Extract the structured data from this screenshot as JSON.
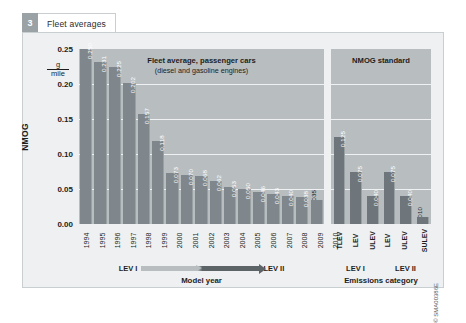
{
  "tab": {
    "number": "3",
    "label": "Fleet averages"
  },
  "credit": "© SMA00386E",
  "panels": {
    "left": {
      "title": "Fleet average, passenger cars",
      "subtitle": "(diesel and gasoline engines)"
    },
    "right": {
      "title": "NMOG standard"
    }
  },
  "yaxis": {
    "title": "NMOG",
    "unit_numerator": "g",
    "unit_denominator": "mile",
    "ticks": [
      "0.25",
      "0.20",
      "0.15",
      "0.10",
      "0.05",
      "0.00"
    ]
  },
  "xaxis_left": {
    "title": "Model year",
    "range_start_label": "LEV I",
    "range_end_label": "LEV II"
  },
  "xaxis_right": {
    "title": "Emissions category",
    "groups": [
      "LEV I",
      "LEV II"
    ]
  },
  "chart_data": {
    "type": "bar",
    "title": "Fleet averages",
    "ylabel": "NMOG",
    "yunit": "g/mile",
    "ylim": [
      0,
      0.25
    ],
    "ytick_values": [
      0.25,
      0.2,
      0.15,
      0.1,
      0.05,
      0.0
    ],
    "grid": true,
    "legend": "none",
    "panels": [
      {
        "name": "Fleet average, passenger cars",
        "subtitle": "(diesel and gasoline engines)",
        "xlabel": "Model year",
        "categories": [
          "1994",
          "1995",
          "1996",
          "1997",
          "1998",
          "1999",
          "2000",
          "2001",
          "2002",
          "2003",
          "2004",
          "2005",
          "2006",
          "2007",
          "2008",
          "2009",
          "2010"
        ],
        "values": [
          0.25,
          0.231,
          0.225,
          0.202,
          0.157,
          0.118,
          0.073,
          0.07,
          0.068,
          0.062,
          0.053,
          0.05,
          0.046,
          0.043,
          0.04,
          0.038,
          0.035
        ],
        "value_labels": [
          "0.250",
          "0.231",
          "0.225",
          "0.202",
          "0.157",
          "0.118",
          "0.073",
          "0.070",
          "0.068",
          "0.062",
          "0.053",
          "0.050",
          "0.046",
          "0.043",
          "0.040",
          "0.038",
          "0.035"
        ]
      },
      {
        "name": "NMOG standard",
        "xlabel": "Emissions category",
        "categories": [
          "TLEV",
          "LEV",
          "ULEV",
          "LEV",
          "ULEV",
          "SULEV"
        ],
        "group_labels": [
          "LEV I",
          "LEV I",
          "LEV I",
          "LEV II",
          "LEV II",
          "LEV II"
        ],
        "values": [
          0.125,
          0.075,
          0.04,
          0.075,
          0.04,
          0.01
        ],
        "value_labels": [
          "0.125",
          "0.075",
          "0.040",
          "0.075",
          "0.040",
          "0.010"
        ]
      }
    ]
  },
  "colors": {
    "page_background": "#ffffff",
    "frame_background": "#eef0f1",
    "plot_background": "#b8bdc0",
    "bar_left": "#7f878c",
    "bar_right": "#6f767b",
    "gridline": "#eef0f1",
    "text": "#1d1d1d",
    "tab_number_background": "#9aa2a6"
  }
}
